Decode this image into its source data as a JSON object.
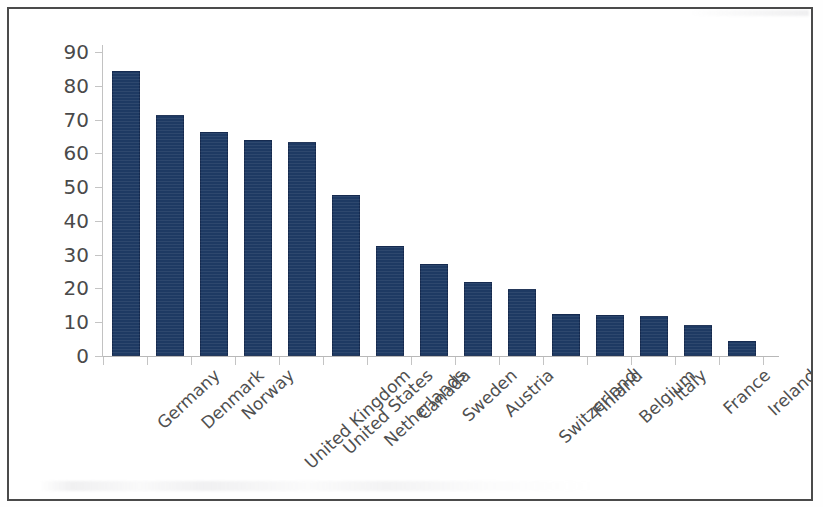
{
  "chart_data": {
    "type": "bar",
    "title": "",
    "subtitle": "",
    "xlabel": "",
    "ylabel": "",
    "ylim": [
      0,
      90
    ],
    "ytick_step": 10,
    "yticks": [
      0,
      10,
      20,
      30,
      40,
      50,
      60,
      70,
      80,
      90
    ],
    "ytick_labels": [
      "0",
      "10",
      "20",
      "30",
      "40",
      "50",
      "60",
      "70",
      "80",
      "90"
    ],
    "grid": false,
    "legend": false,
    "legend_position": "none",
    "bar_color": "#1e3a63",
    "axis_color": "#c2c2c2",
    "label_color": "#4a4a4a",
    "categories": [
      "Germany",
      "Denmark",
      "Norway",
      "United Kingdom",
      "United States",
      "Netherlands",
      "Canada",
      "Sweden",
      "Austria",
      "Switzerland",
      "Finland",
      "Belgium",
      "Italy",
      "France",
      "Ireland"
    ],
    "values": [
      84.5,
      71.3,
      66.3,
      64.0,
      63.4,
      47.6,
      32.5,
      27.3,
      22.0,
      19.8,
      12.3,
      12.2,
      11.8,
      9.2,
      4.5
    ]
  },
  "frame": {
    "border_color": "#4a4a4a"
  }
}
